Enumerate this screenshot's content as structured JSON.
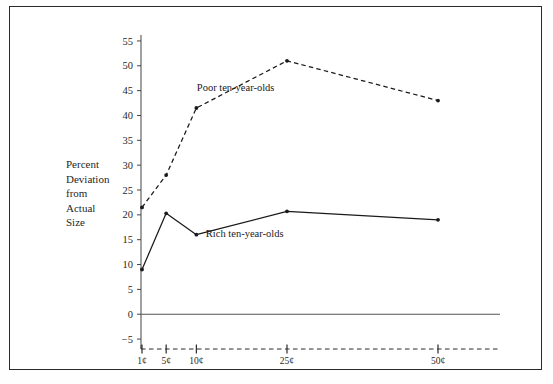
{
  "chart_data": {
    "type": "line",
    "title": "",
    "xlabel": "",
    "ylabel": "Percent Deviation from Actual Size",
    "ylabel_lines": [
      "Percent",
      "Deviation",
      "from",
      "Actual",
      "Size"
    ],
    "categories": [
      "1¢",
      "5¢",
      "10¢",
      "25¢",
      "50¢"
    ],
    "x": [
      1,
      5,
      10,
      25,
      50
    ],
    "xlim": [
      1,
      50
    ],
    "ylim": [
      -7,
      57
    ],
    "yticks": [
      -5,
      0,
      5,
      10,
      15,
      20,
      25,
      30,
      35,
      40,
      45,
      50,
      55
    ],
    "ytick_labels": [
      "−5",
      "0",
      "5",
      "10",
      "15",
      "20",
      "25",
      "30",
      "35",
      "40",
      "45",
      "50",
      "55"
    ],
    "grid": false,
    "legend_position": "inline-annotations",
    "zero_line": 0,
    "series": [
      {
        "name": "Poor ten-year-olds",
        "label": "Poor ten-year-olds",
        "style": "dashed",
        "color": "#1a1a1a",
        "values": [
          21.5,
          28.0,
          41.5,
          51.0,
          43.0
        ]
      },
      {
        "name": "Rich ten-year-olds",
        "label": "Rich ten-year-olds",
        "style": "solid",
        "color": "#1a1a1a",
        "values": [
          9.0,
          20.3,
          16.0,
          20.7,
          19.0
        ]
      }
    ],
    "annotations": [
      {
        "text": "Poor ten-year-olds",
        "x": 16.5,
        "y": 45.0
      },
      {
        "text": "Rich ten-year-olds",
        "x": 18.0,
        "y": 15.5
      }
    ]
  }
}
